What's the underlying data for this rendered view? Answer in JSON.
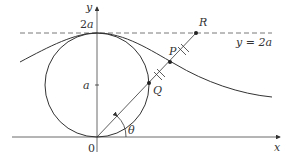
{
  "diagram": {
    "labels": {
      "y_axis": "y",
      "x_axis": "x",
      "two_a": "2a",
      "a": "a",
      "origin": "0",
      "R": "R",
      "P": "P",
      "Q": "Q",
      "theta": "θ",
      "line_eq": "y = 2a"
    },
    "colors": {
      "stroke": "#333333",
      "dashed": "#555555"
    }
  }
}
